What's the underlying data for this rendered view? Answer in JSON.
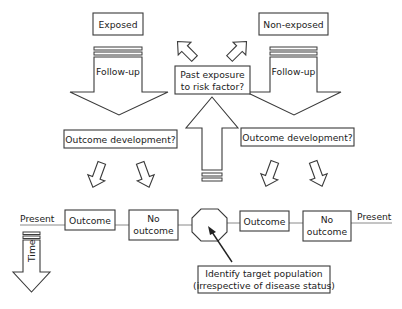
{
  "diagram": {
    "type": "case-control / cohort study design flow",
    "colors": {
      "stroke": "#3a3a3a",
      "fill": "#ffffff",
      "timeline": "#8a8a8a",
      "text": "#222222"
    },
    "top_boxes": {
      "exposed": "Exposed",
      "non_exposed": "Non-exposed"
    },
    "follow_up": {
      "left": "Follow-up",
      "right": "Follow-up"
    },
    "center_question": {
      "line1": "Past exposure",
      "line2": "to risk factor?"
    },
    "outcome_development": {
      "left": "Outcome development?",
      "right": "Outcome development?"
    },
    "timeline": {
      "left_label": "Present",
      "right_label": "Present"
    },
    "outcome_boxes": {
      "left_outcome": "Outcome",
      "left_no_outcome_line1": "No",
      "left_no_outcome_line2": "outcome",
      "right_outcome": "Outcome",
      "right_no_outcome_line1": "No",
      "right_no_outcome_line2": "outcome"
    },
    "target_population": {
      "line1": "Identify target population",
      "line2": "(irrespective of disease status)"
    },
    "time_arrow": {
      "label": "Time"
    }
  }
}
